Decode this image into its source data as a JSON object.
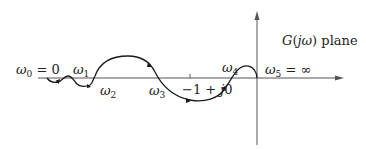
{
  "diagram": {
    "type": "nyquist-plot",
    "plane_label": {
      "func": "G",
      "arg": "jω",
      "suffix": "plane"
    },
    "axes": {
      "real_axis": {
        "direction": "right",
        "arrow": true
      },
      "imag_axis": {
        "direction": "up",
        "arrow": true
      }
    },
    "critical_point": {
      "label_prefix": "−1 + ",
      "label_j": "j",
      "label_suffix": "0"
    },
    "frequency_labels": [
      {
        "sym": "ω",
        "sub": "0",
        "rest": " = 0"
      },
      {
        "sym": "ω",
        "sub": "1",
        "rest": ""
      },
      {
        "sym": "ω",
        "sub": "2",
        "rest": ""
      },
      {
        "sym": "ω",
        "sub": "3",
        "rest": ""
      },
      {
        "sym": "ω",
        "sub": "4",
        "rest": ""
      },
      {
        "sym": "ω",
        "sub": "5",
        "rest": " = ∞"
      }
    ],
    "colors": {
      "axis": "#555555",
      "curve": "#1a1a1a",
      "text": "#222222"
    }
  }
}
